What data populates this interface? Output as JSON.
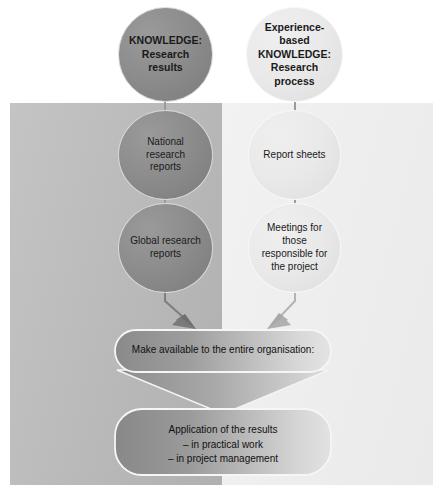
{
  "diagram": {
    "colors": {
      "panel_left": "#bdbdbd",
      "panel_right": "#eeeeee",
      "circle_dark": "#8d8d8d",
      "circle_light": "#e9e9e9",
      "arrow": "#7a7a7a",
      "text": "#111111"
    },
    "columns": [
      {
        "id": "research-results",
        "panel": "left"
      },
      {
        "id": "research-process",
        "panel": "right"
      }
    ],
    "nodes": {
      "knowledge_research_results": {
        "line1": "KNOWLEDGE:",
        "line2": "Research results"
      },
      "experience_knowledge": {
        "line1": "Experience-based",
        "line2": "KNOWLEDGE:",
        "line3": "Research process"
      },
      "national_reports": {
        "line1": "National research",
        "line2": "reports"
      },
      "report_sheets": {
        "line1": "Report sheets"
      },
      "global_reports": {
        "line1": "Global research",
        "line2": "reports"
      },
      "meetings": {
        "line1": "Meetings for those",
        "line2": "responsible for",
        "line3": "the project"
      }
    },
    "bars": {
      "make_available": {
        "label": "Make available to the entire organisation:"
      },
      "application": {
        "line1": "Application of the results",
        "line2": "– in practical work",
        "line3": "– in project management"
      }
    },
    "arrows": [
      {
        "id": "arrow-left-to-bar",
        "from": "global_reports",
        "to": "make_available",
        "direction": "down-right"
      },
      {
        "id": "arrow-right-to-bar",
        "from": "meetings",
        "to": "make_available",
        "direction": "down-left"
      }
    ]
  }
}
